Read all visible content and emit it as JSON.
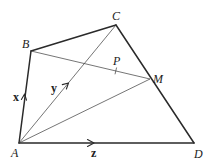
{
  "diagram": {
    "points": {
      "A": {
        "label": "A",
        "x": 19,
        "y": 143
      },
      "B": {
        "label": "B",
        "x": 31,
        "y": 51
      },
      "C": {
        "label": "C",
        "x": 116,
        "y": 25
      },
      "D": {
        "label": "D",
        "x": 194,
        "y": 143
      },
      "M": {
        "label": "M",
        "x": 150,
        "y": 79
      },
      "P": {
        "label": "P",
        "x": 116,
        "y": 71
      }
    },
    "vectors": {
      "x": {
        "label": "x",
        "from": "A",
        "to": "B"
      },
      "y": {
        "label": "y",
        "from": "A",
        "to": "C"
      },
      "z": {
        "label": "z",
        "from": "A",
        "to": "D"
      }
    },
    "edges": [
      "AB",
      "BC",
      "CD",
      "DA"
    ],
    "segments": [
      "AC",
      "AM",
      "BM"
    ]
  }
}
